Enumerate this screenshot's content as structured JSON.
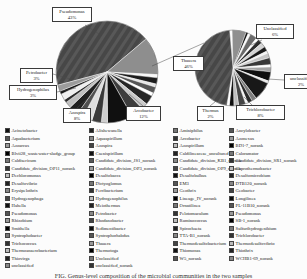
{
  "caption": {
    "text": "FIG.  Genus-level composition of the microbial communities in the two samples"
  },
  "colors": {
    "background": "#fcfcfc",
    "hatch_base": "#474747",
    "hatch_line": "#585858",
    "slice_stroke": "#f8f8f8"
  },
  "legend_palette": [
    "#111111",
    "#555555",
    "#999999",
    "#000000",
    "#777777",
    "#333333",
    "#bbbbbb",
    "#222222",
    "#888888",
    "#444444"
  ],
  "chart_data": [
    {
      "type": "pie",
      "id": "left-pie",
      "title": "",
      "cx": 107,
      "cy": 72,
      "r": 51,
      "start_angle": 255,
      "slices": [
        {
          "label": "Pseudomonas",
          "value": 43,
          "color": "#484848",
          "hatch": true
        },
        {
          "label": "Arcobacter",
          "value": 12,
          "color": "#8e8e8e"
        },
        {
          "label": "",
          "value": 1,
          "color": "#f7f7f7"
        },
        {
          "label": "",
          "value": 2,
          "color": "#1c1c1c"
        },
        {
          "label": "",
          "value": 1,
          "color": "#e6e6e6"
        },
        {
          "label": "",
          "value": 2,
          "color": "#565656"
        },
        {
          "label": "",
          "value": 1,
          "color": "#ffffff"
        },
        {
          "label": "",
          "value": 3,
          "color": "#262626"
        },
        {
          "label": "",
          "value": 2,
          "color": "#c9c9c9"
        },
        {
          "label": "",
          "value": 4,
          "color": "#3d3d3d"
        },
        {
          "label": "Azospira",
          "value": 8,
          "color": "#101010"
        },
        {
          "label": "",
          "value": 2,
          "color": "#cfcfcf"
        },
        {
          "label": "",
          "value": 3,
          "color": "#3a3a3a"
        },
        {
          "label": "Hydrogenophilus",
          "value": 3,
          "color": "#dedede"
        },
        {
          "label": "",
          "value": 2,
          "color": "#4f4f4f"
        },
        {
          "label": "Petrobacter",
          "value": 3,
          "color": "#1f1f1f"
        },
        {
          "label": "",
          "value": 2,
          "color": "#bfbfbf"
        },
        {
          "label": "",
          "value": 1,
          "color": "#2b2b2b"
        },
        {
          "label": "",
          "value": 2,
          "color": "#efefef"
        },
        {
          "label": "",
          "value": 1,
          "color": "#151515"
        },
        {
          "label": "",
          "value": 2,
          "color": "#9b9b9b"
        }
      ]
    },
    {
      "type": "pie",
      "id": "right-pie",
      "title": "",
      "cx": 233,
      "cy": 68,
      "r": 38,
      "start_angle": 355,
      "slices": [
        {
          "label": "",
          "value": 1,
          "color": "#fafafa"
        },
        {
          "label": "Unclassified",
          "value": 6,
          "color": "#8f8f8f"
        },
        {
          "label": "",
          "value": 1,
          "color": "#151515"
        },
        {
          "label": "",
          "value": 1,
          "color": "#fcfcfc"
        },
        {
          "label": "",
          "value": 3,
          "color": "#6a6a6a"
        },
        {
          "label": "",
          "value": 1,
          "color": "#ffffff"
        },
        {
          "label": "",
          "value": 2,
          "color": "#2e2e2e"
        },
        {
          "label": "",
          "value": 2,
          "color": "#d5d5d5"
        },
        {
          "label": "",
          "value": 2,
          "color": "#1a1a1a"
        },
        {
          "label": "",
          "value": 1,
          "color": "#f2f2f2"
        },
        {
          "label": "unclassified",
          "value": 2,
          "color": "#c6c6c6"
        },
        {
          "label": "",
          "value": 3,
          "color": "#383838"
        },
        {
          "label": "",
          "value": 1,
          "color": "#ffffff"
        },
        {
          "label": "",
          "value": 2,
          "color": "#a3a3a3"
        },
        {
          "label": "",
          "value": 4,
          "color": "#0f0f0f"
        },
        {
          "label": "",
          "value": 1,
          "color": "#eaeaea"
        },
        {
          "label": "Trichlorobacter",
          "value": 8,
          "color": "#181818"
        },
        {
          "label": "",
          "value": 2,
          "color": "#7d7d7d"
        },
        {
          "label": "Thermus",
          "value": 2,
          "color": "#2a2a2a"
        },
        {
          "label": "",
          "value": 1,
          "color": "#f5f5f5"
        },
        {
          "label": "",
          "value": 3,
          "color": "#454545"
        },
        {
          "label": "",
          "value": 2,
          "color": "#bdbdbd"
        },
        {
          "label": "",
          "value": 2,
          "color": "#101010"
        },
        {
          "label": "",
          "value": 1,
          "color": "#ffffff"
        },
        {
          "label": "Thauera",
          "value": 46,
          "color": "#4a4a4a",
          "hatch": true
        }
      ]
    }
  ],
  "callouts": [
    {
      "x": 52,
      "y": 7,
      "w": 40,
      "name": "Pseudomonas",
      "pct": "43%"
    },
    {
      "x": 20,
      "y": 68,
      "w": 33,
      "name": "Petrobacter",
      "pct": "3%"
    },
    {
      "x": 9,
      "y": 85,
      "w": 48,
      "name": "Hydrogenophilus",
      "pct": "3%"
    },
    {
      "x": 63,
      "y": 108,
      "w": 28,
      "name": "Azospira",
      "pct": "8%"
    },
    {
      "x": 126,
      "y": 106,
      "w": 35,
      "name": "Arcobacter",
      "pct": "12%"
    },
    {
      "x": 256,
      "y": 24,
      "w": 38,
      "name": "Unclassified",
      "pct": "6%"
    },
    {
      "x": 173,
      "y": 56,
      "w": 31,
      "name": "Thauera",
      "pct": "46%"
    },
    {
      "x": 284,
      "y": 74,
      "w": 34,
      "name": "unclassified",
      "pct": "2%"
    },
    {
      "x": 197,
      "y": 106,
      "w": 27,
      "name": "Thermus",
      "pct": "2%"
    },
    {
      "x": 236,
      "y": 105,
      "w": 49,
      "name": "Trichlorobacter",
      "pct": "8%"
    }
  ],
  "leaders": [
    [
      152,
      66,
      204,
      43
    ],
    [
      85,
      25,
      99,
      34
    ],
    [
      53,
      74,
      70,
      79
    ],
    [
      57,
      92,
      76,
      88
    ],
    [
      77,
      108,
      87,
      99
    ],
    [
      143,
      106,
      129,
      94
    ],
    [
      262,
      40,
      251,
      45
    ],
    [
      204,
      63,
      211,
      66
    ],
    [
      284,
      80,
      268,
      79
    ],
    [
      210,
      106,
      221,
      97
    ],
    [
      252,
      105,
      244,
      97
    ]
  ],
  "legend": {
    "column_x": [
      5,
      89,
      173,
      229
    ],
    "columns": [
      {
        "items": [
          "Acinetobacter",
          "Aquabacterium",
          "Azoarcus",
          "Blvii28_wastewater-sludge_group",
          "Caldisericum",
          "Candidate_division_OP11_norank",
          "Dechloromonas",
          "Desulfovibrio",
          "Erysipelothrix",
          "Hydrogenophaga",
          "Hahella",
          "Pseudomonas",
          "Rhizobium",
          "Smithella",
          "Syntrophobacter",
          "Trichococcus",
          "Thermoanaerobacterium",
          "Thiovirga",
          "unclassified"
        ]
      },
      {
        "items": [
          "Alishewanella",
          "Aquaspirillum",
          "Azospira",
          "Caenispirillum",
          "Candidate_division_JS1_norank",
          "Candidate_division_OP3_norank",
          "Desulfobacca",
          "Dictyoglomus",
          "Ferribacterium",
          "Hydrogenophilus",
          "Meiothermus",
          "Petrobacter",
          "Rhodanobacter",
          "Sedimentibacter",
          "Syntrophorhabdus",
          "Thauera",
          "Thermotoga",
          "Unclassified",
          "unclassified_norank"
        ]
      },
      {
        "items": [
          "Aminiphilus",
          "Arcobacter",
          "Azospirillum",
          "Caldilineaceae_uncultured",
          "Candidate_division_KB1_norank",
          "Candidate_division_OP9_norank",
          "Desulfobulbus",
          "EM3",
          "Geothrix",
          "Lineage_IV_norank",
          "Ornatilinea",
          "Pelotomaculum",
          "Ruminococcus",
          "Spirochaeta",
          "TTA-B1_norank",
          "Thermodesulfobacterium",
          "Thiomonas",
          "W5_norank"
        ]
      },
      {
        "items": [
          "Ancylobacter",
          "Azonexus",
          "BD1-7_norank",
          "Caloramator",
          "Candidate_division_SR1_norank",
          "Coprothermobacter",
          "Desulfomicrobium",
          "DTB120_norank",
          "Geobacter",
          "Longilinea",
          "PL-11B10_norank",
          "Pseudomonas",
          "SB-1_norank",
          "Sulfurihydrogenibium",
          "Trichlorobacter",
          "Thermodesulfovibrio",
          "Thiothrix",
          "WCHB1-69_norank"
        ]
      }
    ]
  }
}
